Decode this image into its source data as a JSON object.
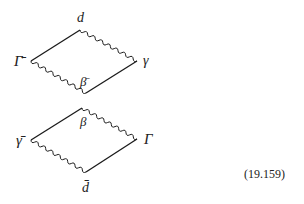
{
  "equation_number": "(19.159)",
  "diagrams": [
    {
      "name": "upper",
      "vertices": {
        "left": {
          "x": 31,
          "y": 61,
          "label": "Γ̄"
        },
        "top": {
          "x": 80,
          "y": 30,
          "label": "d"
        },
        "right": {
          "x": 137,
          "y": 61,
          "label": "γ"
        },
        "bottom": {
          "x": 86,
          "y": 93,
          "label": "β̄"
        }
      },
      "edges": [
        {
          "from": "left",
          "to": "top",
          "style": "straight"
        },
        {
          "from": "top",
          "to": "right",
          "style": "wavy"
        },
        {
          "from": "left",
          "to": "bottom",
          "style": "wavy"
        },
        {
          "from": "bottom",
          "to": "right",
          "style": "straight"
        }
      ]
    },
    {
      "name": "lower",
      "vertices": {
        "left": {
          "x": 31,
          "y": 140,
          "label": "γ̄"
        },
        "top": {
          "x": 82,
          "y": 108,
          "label": "β"
        },
        "right": {
          "x": 137,
          "y": 139,
          "label": "Γ"
        },
        "bottom": {
          "x": 86,
          "y": 172,
          "label": "d̄"
        }
      },
      "edges": [
        {
          "from": "left",
          "to": "top",
          "style": "straight"
        },
        {
          "from": "top",
          "to": "right",
          "style": "wavy"
        },
        {
          "from": "left",
          "to": "bottom",
          "style": "wavy"
        },
        {
          "from": "bottom",
          "to": "right",
          "style": "straight"
        }
      ]
    }
  ],
  "labels": {
    "upper_left": "Γ̄",
    "upper_top": "d",
    "upper_right": "γ",
    "upper_bottom": "β̄",
    "lower_left": "γ̄",
    "lower_top": "β",
    "lower_right": "Γ",
    "lower_bottom": "d̄"
  }
}
